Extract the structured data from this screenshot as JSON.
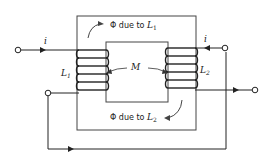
{
  "diagram": {
    "type": "mutually coupled coils on magnetic core",
    "labels": {
      "flux_top": {
        "prefix": "Φ due to ",
        "var": "L",
        "sub": "1"
      },
      "flux_bottom": {
        "prefix": "Φ due to ",
        "var": "L",
        "sub": "2"
      },
      "coil_left": {
        "var": "L",
        "sub": "1"
      },
      "coil_right": {
        "var": "L",
        "sub": "2"
      },
      "mutual": "M",
      "current_left": "i",
      "current_right": "i"
    },
    "colors": {
      "line": "#222222",
      "core": "#444444",
      "background": "#ffffff"
    }
  }
}
